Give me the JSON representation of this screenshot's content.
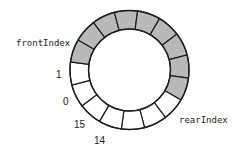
{
  "diagram": {
    "ring": {
      "center_x": 129.5,
      "center_y": 70,
      "outer_radius": 59.5,
      "inner_radius": 41,
      "cell_count": 16,
      "index_1_center_angle_deg": 176.6,
      "direction": "clockwise-increasing"
    },
    "colors": {
      "filled": "#b9b9b9",
      "empty": "#ffffff",
      "stroke": "#1e1e1e",
      "text": "#222222"
    },
    "cells": [
      {
        "index": 0,
        "filled": false
      },
      {
        "index": 1,
        "filled": false
      },
      {
        "index": 2,
        "filled": true
      },
      {
        "index": 3,
        "filled": true
      },
      {
        "index": 4,
        "filled": true
      },
      {
        "index": 5,
        "filled": true
      },
      {
        "index": 6,
        "filled": true
      },
      {
        "index": 7,
        "filled": true
      },
      {
        "index": 8,
        "filled": true
      },
      {
        "index": 9,
        "filled": true
      },
      {
        "index": 10,
        "filled": true
      },
      {
        "index": 11,
        "filled": false
      },
      {
        "index": 12,
        "filled": false
      },
      {
        "index": 13,
        "filled": false
      },
      {
        "index": 14,
        "filled": false
      },
      {
        "index": 15,
        "filled": false
      }
    ],
    "pointers": {
      "front": {
        "label": "frontIndex",
        "points_to_index": 2,
        "x": 16,
        "y": 39
      },
      "rear": {
        "label": "rearIndex",
        "points_to_index": 10,
        "x": 179,
        "y": 116
      }
    },
    "index_labels": [
      {
        "text": "1",
        "x": 56,
        "y": 70
      },
      {
        "text": "0",
        "x": 63,
        "y": 97
      },
      {
        "text": "15",
        "x": 74,
        "y": 120
      },
      {
        "text": "14",
        "x": 94,
        "y": 136
      }
    ]
  }
}
